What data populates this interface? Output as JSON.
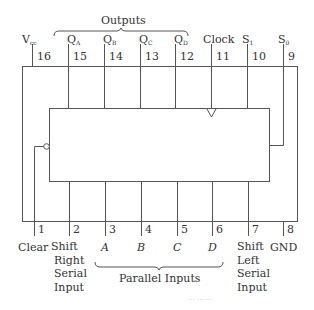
{
  "diagram": {
    "groups": {
      "outputs": "Outputs",
      "parallel_inputs": "Parallel Inputs"
    },
    "top_pins": [
      {
        "number": "16",
        "label": "V",
        "sub": "cc"
      },
      {
        "number": "15",
        "label": "Q",
        "sub": "A"
      },
      {
        "number": "14",
        "label": "Q",
        "sub": "B"
      },
      {
        "number": "13",
        "label": "Q",
        "sub": "C"
      },
      {
        "number": "12",
        "label": "Q",
        "sub": "D"
      },
      {
        "number": "11",
        "label": "Clock",
        "sub": ""
      },
      {
        "number": "10",
        "label": "S",
        "sub": "1"
      },
      {
        "number": "9",
        "label": "S",
        "sub": "0"
      }
    ],
    "bottom_pins": [
      {
        "number": "1",
        "label": "Clear"
      },
      {
        "number": "2",
        "label_lines": [
          "Shift",
          "Right",
          "Serial",
          "Input"
        ]
      },
      {
        "number": "3",
        "label": "A"
      },
      {
        "number": "4",
        "label": "B"
      },
      {
        "number": "5",
        "label": "C"
      },
      {
        "number": "6",
        "label": "D"
      },
      {
        "number": "7",
        "label_lines": [
          "Shift",
          "Left",
          "Serial",
          "Input"
        ]
      },
      {
        "number": "8",
        "label": "GND"
      }
    ],
    "caption": "··· ··· ···"
  }
}
